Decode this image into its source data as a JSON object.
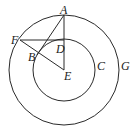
{
  "diagram": {
    "type": "geometry",
    "circles": [
      {
        "name": "C",
        "center": "E",
        "role": "inner"
      },
      {
        "name": "G",
        "center": "E",
        "role": "outer"
      }
    ],
    "points": {
      "A": {
        "label": "A"
      },
      "B": {
        "label": "B"
      },
      "D": {
        "label": "D"
      },
      "E": {
        "label": "E"
      },
      "F": {
        "label": "F"
      }
    },
    "circle_labels": {
      "C": "C",
      "G": "G"
    },
    "segments": [
      "A-E",
      "A-B",
      "F-D",
      "F-E"
    ]
  }
}
